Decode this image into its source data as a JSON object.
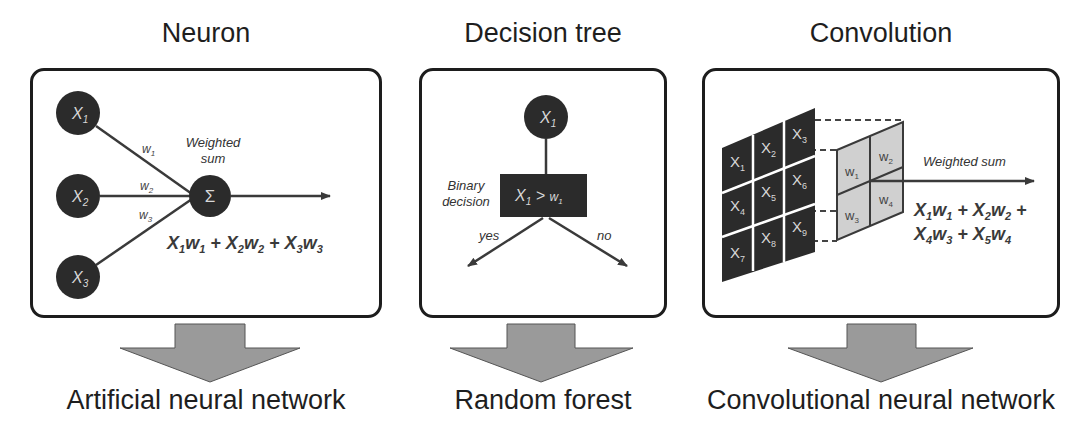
{
  "panels": [
    {
      "title": "Neuron",
      "caption": "Artificial neural network",
      "inputs": [
        "X",
        "X",
        "X"
      ],
      "input_subs": [
        "1",
        "2",
        "3"
      ],
      "weights": [
        "w",
        "w",
        "w"
      ],
      "weight_subs": [
        "1",
        "2",
        "3"
      ],
      "node_symbol": "Σ",
      "node_label_line1": "Weighted",
      "node_label_line2": "sum",
      "formula": [
        {
          "v": "X",
          "s": "1"
        },
        {
          "v": "w",
          "s": "1"
        },
        {
          "op": " + "
        },
        {
          "v": "X",
          "s": "2"
        },
        {
          "v": "w",
          "s": "2"
        },
        {
          "op": " + "
        },
        {
          "v": "X",
          "s": "3"
        },
        {
          "v": "w",
          "s": "3"
        }
      ]
    },
    {
      "title": "Decision tree",
      "caption": "Random forest",
      "root": "X",
      "root_sub": "1",
      "decision_label_line1": "Binary",
      "decision_label_line2": "decision",
      "decision_var": "X",
      "decision_var_sub": "1",
      "decision_op": " > ",
      "decision_threshold": "w",
      "decision_threshold_sub": "1",
      "branch_yes": "yes",
      "branch_no": "no"
    },
    {
      "title": "Convolution",
      "caption": "Convolutional neural network",
      "input_grid": [
        "1",
        "2",
        "3",
        "4",
        "5",
        "6",
        "7",
        "8",
        "9"
      ],
      "input_var": "X",
      "kernel": [
        "1",
        "2",
        "3",
        "4"
      ],
      "kernel_var": "w",
      "output_label": "Weighted sum",
      "formula_line1": [
        {
          "v": "X",
          "s": "1"
        },
        {
          "v": "w",
          "s": "1"
        },
        {
          "op": " + "
        },
        {
          "v": "X",
          "s": "2"
        },
        {
          "v": "w",
          "s": "2"
        },
        {
          "op": " +"
        }
      ],
      "formula_line2": [
        {
          "v": "X",
          "s": "4"
        },
        {
          "v": "w",
          "s": "3"
        },
        {
          "op": " + "
        },
        {
          "v": "X",
          "s": "5"
        },
        {
          "v": "w",
          "s": "4"
        }
      ]
    }
  ],
  "colors": {
    "node_fill": "#2b2b2b",
    "box_border": "#1d1d1d",
    "arrow_fill": "#9a9a9a",
    "kernel_fill": "#d0d0d0",
    "line": "#3a3a3a"
  }
}
